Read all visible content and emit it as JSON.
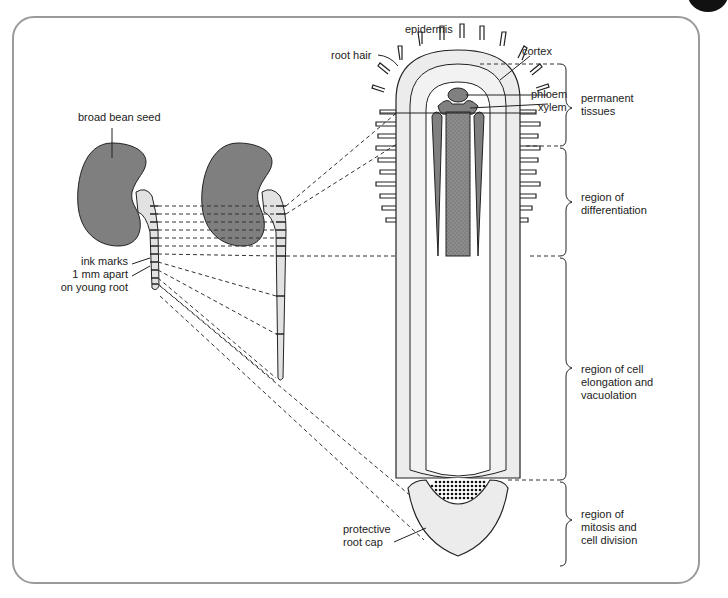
{
  "figure": {
    "colors": {
      "seed": "#7f7f7f",
      "root_fill": "#e2e2e2",
      "vascular_dark": "#808080",
      "outline": "#222222",
      "frame": "#9a9a9a"
    }
  },
  "labels": {
    "broad_bean_seed": "broad bean seed",
    "ink_marks_1": "ink marks",
    "ink_marks_2": "1 mm apart",
    "ink_marks_3": "on young root",
    "epidermis": "epidermis",
    "root_hair": "root hair",
    "cortex": "cortex",
    "phloem": "phloem",
    "xylem": "xylem",
    "protective_1": "protective",
    "protective_2": "root cap"
  },
  "regions": [
    {
      "line1": "permanent",
      "line2": "tissues",
      "line3": ""
    },
    {
      "line1": "region of",
      "line2": "differentiation",
      "line3": ""
    },
    {
      "line1": "region of cell",
      "line2": "elongation and",
      "line3": "vacuolation"
    },
    {
      "line1": "region of",
      "line2": "mitosis and",
      "line3": "cell division"
    }
  ]
}
